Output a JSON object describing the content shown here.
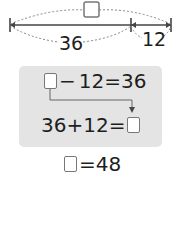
{
  "diagram": {
    "type": "tape-diagram",
    "total_label": "□",
    "segments": [
      {
        "label": "36"
      },
      {
        "label": "12"
      }
    ]
  },
  "equations": {
    "eq1": {
      "unknown": "□",
      "op": "−",
      "a": "12",
      "eq": "=",
      "result": "36"
    },
    "eq2": {
      "a": "36",
      "op": "+",
      "b": "12",
      "eq": "=",
      "unknown": "□"
    },
    "answer": {
      "unknown": "□",
      "eq": "=",
      "value": "48"
    }
  },
  "colors": {
    "panel": "#e4e4e4",
    "line": "#444444",
    "dotted": "#888888",
    "box_border": "#777777"
  }
}
